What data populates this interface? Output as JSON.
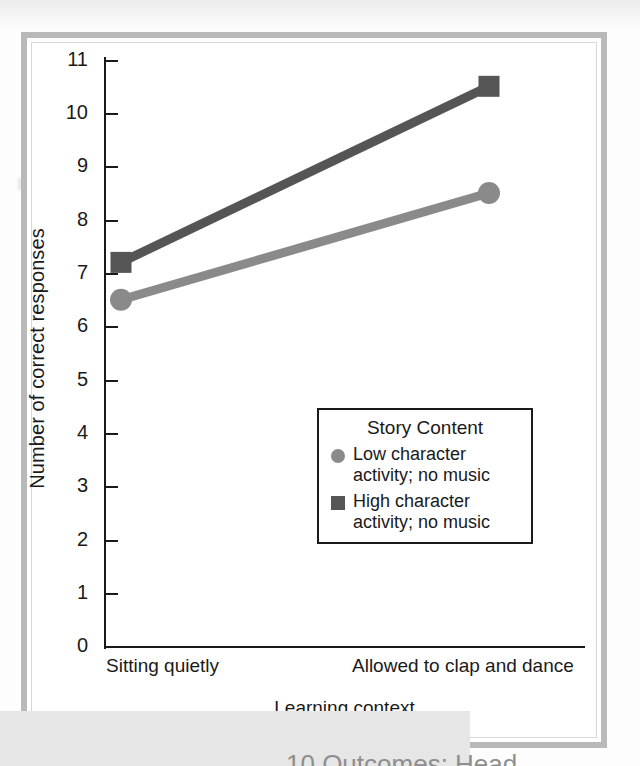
{
  "chart_data": {
    "type": "line",
    "title": "",
    "subtitle": "",
    "xlabel": "Learning context",
    "ylabel": "Number of correct responses",
    "categories": [
      "Sitting quietly",
      "Allowed to clap and dance"
    ],
    "ylim": [
      0,
      11
    ],
    "yticks": [
      0,
      1,
      2,
      3,
      4,
      5,
      6,
      7,
      8,
      9,
      10,
      11
    ],
    "ytick_labels": [
      "0",
      "1",
      "2",
      "3",
      "4",
      "5",
      "6",
      "7",
      "8",
      "9",
      "10",
      "11"
    ],
    "grid": false,
    "legend_position": "inside-lower-right",
    "legend_title": "Story Content",
    "series": [
      {
        "name": "Low character activity; no music",
        "values": [
          6.5,
          8.5
        ],
        "color": "#8a8a8a",
        "marker": "circle"
      },
      {
        "name": "High character activity; no music",
        "values": [
          7.2,
          10.5
        ],
        "color": "#555555",
        "marker": "square"
      }
    ],
    "annotations": []
  },
  "axes": {
    "ylabel": "Number of correct responses",
    "xlabel": "Learning context",
    "ytick_labels": [
      "11",
      "10",
      "9",
      "8",
      "7",
      "6",
      "5",
      "4",
      "3",
      "2",
      "1",
      "0"
    ],
    "xcat_left": "Sitting quietly",
    "xcat_right": "Allowed to clap and dance"
  },
  "legend": {
    "title": "Story Content",
    "items": [
      {
        "marker": "circle-swatch",
        "line1": "Low character",
        "line2": "activity; no music",
        "color": "#8a8a8a"
      },
      {
        "marker": "square-swatch",
        "line1": "High character",
        "line2": "activity; no music",
        "color": "#555555"
      }
    ]
  },
  "page": {
    "caption_fragment": "10 Outcomes: Head"
  },
  "colors": {
    "series_low": "#8a8a8a",
    "series_high": "#555555",
    "axis": "#1a1a1a",
    "frame": "#b9b9b9",
    "background": "#ffffff"
  }
}
